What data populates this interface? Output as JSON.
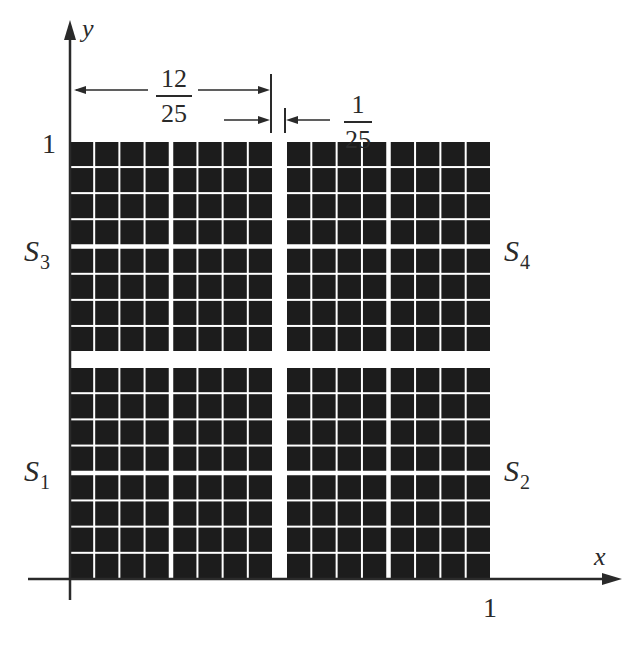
{
  "figure": {
    "axes": {
      "x_label": "x",
      "y_label": "y",
      "x_tick": "1",
      "y_tick": "1"
    },
    "regions": [
      {
        "id": "S1",
        "label": "S",
        "sub": "1",
        "position": "bottom-left"
      },
      {
        "id": "S2",
        "label": "S",
        "sub": "2",
        "position": "bottom-right"
      },
      {
        "id": "S3",
        "label": "S",
        "sub": "3",
        "position": "top-left"
      },
      {
        "id": "S4",
        "label": "S",
        "sub": "4",
        "position": "top-right"
      }
    ],
    "dimensions": {
      "half_width": {
        "numerator": "12",
        "denominator": "25"
      },
      "gap_width": {
        "numerator": "1",
        "denominator": "25"
      }
    },
    "grid": {
      "cells_per_quadrant_side": 8,
      "cell_color": "#1c1c1c",
      "gap_color": "#ffffff"
    }
  }
}
